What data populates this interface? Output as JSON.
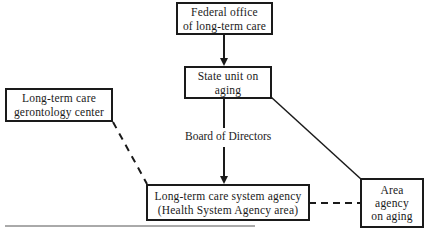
{
  "diagram": {
    "nodes": [
      {
        "id": "federal",
        "lines": [
          "Federal office",
          "of long-term care"
        ]
      },
      {
        "id": "state",
        "lines": [
          "State unit on",
          "aging"
        ]
      },
      {
        "id": "gerontology",
        "lines": [
          "Long-term care",
          "gerontology center"
        ]
      },
      {
        "id": "system_agency",
        "lines": [
          "Long-term care system agency",
          "(Health System Agency area)"
        ]
      },
      {
        "id": "area_agency",
        "lines": [
          "Area",
          "agency",
          "on aging"
        ]
      }
    ],
    "edges": [
      {
        "from": "federal",
        "to": "state",
        "style": "solid-arrow"
      },
      {
        "from": "state",
        "to": "system_agency",
        "style": "solid-arrow",
        "label": "Board of Directors"
      },
      {
        "from": "state",
        "to": "area_agency",
        "style": "solid"
      },
      {
        "from": "gerontology",
        "to": "system_agency",
        "style": "dashed"
      },
      {
        "from": "system_agency",
        "to": "area_agency",
        "style": "dashed"
      }
    ],
    "edge_label": "Board of Directors",
    "line_color": "#1a1a1a"
  }
}
